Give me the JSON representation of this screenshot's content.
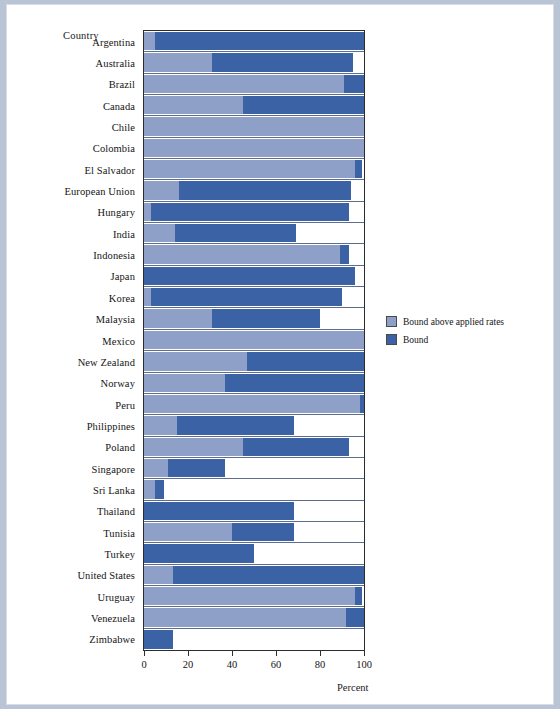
{
  "axis_titles": {
    "y": "Country",
    "x": "Percent"
  },
  "legend": {
    "items": [
      {
        "label": "Bound above applied rates",
        "color": "#8e9fc8",
        "key": "bound_above_applied"
      },
      {
        "label": "Bound",
        "color": "#3c62a6",
        "key": "bound"
      }
    ]
  },
  "xaxis": {
    "ticks": [
      "0",
      "20",
      "40",
      "60",
      "80",
      "100"
    ],
    "min": 0,
    "max": 100
  },
  "chart_data": {
    "type": "bar",
    "orientation": "horizontal",
    "stacked": true,
    "title": "",
    "xlabel": "Percent",
    "ylabel": "Country",
    "xlim": [
      0,
      100
    ],
    "grid": false,
    "legend_position": "right",
    "categories": [
      "Argentina",
      "Australia",
      "Brazil",
      "Canada",
      "Chile",
      "Colombia",
      "El Salvador",
      "European Union",
      "Hungary",
      "India",
      "Indonesia",
      "Japan",
      "Korea",
      "Malaysia",
      "Mexico",
      "New Zealand",
      "Norway",
      "Peru",
      "Philippines",
      "Poland",
      "Singapore",
      "Sri Lanka",
      "Thailand",
      "Tunisia",
      "Turkey",
      "United States",
      "Uruguay",
      "Venezuela",
      "Zimbabwe"
    ],
    "series": [
      {
        "name": "Bound above applied rates",
        "color": "#8e9fc8",
        "values": [
          5,
          31,
          91,
          45,
          100,
          100,
          96,
          16,
          3,
          14,
          89,
          0,
          3,
          31,
          100,
          47,
          37,
          98,
          15,
          45,
          11,
          5,
          0,
          40,
          0,
          13,
          96,
          92,
          0
        ]
      },
      {
        "name": "Bound",
        "color": "#3c62a6",
        "values": [
          95,
          64,
          9,
          55,
          0,
          0,
          3,
          78,
          90,
          55,
          4,
          96,
          87,
          49,
          0,
          53,
          63,
          2,
          53,
          48,
          26,
          4,
          68,
          28,
          50,
          87,
          3,
          8,
          13
        ]
      }
    ],
    "totals": [
      100,
      95,
      100,
      100,
      100,
      100,
      99,
      94,
      93,
      69,
      93,
      96,
      90,
      80,
      100,
      100,
      100,
      100,
      68,
      93,
      37,
      9,
      68,
      68,
      50,
      100,
      99,
      100,
      13
    ]
  }
}
